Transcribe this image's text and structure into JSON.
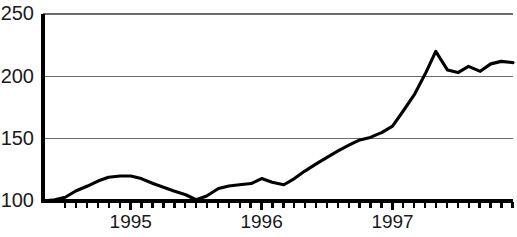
{
  "chart_data": {
    "type": "line",
    "title": "",
    "subtitle": "",
    "xlabel": "",
    "ylabel": "",
    "xlim": [
      1994.33,
      1997.92
    ],
    "ylim": [
      100,
      250
    ],
    "grid": true,
    "grid_axis": "y",
    "legend": false,
    "legend_position": "none",
    "y_ticks": [
      100,
      150,
      200,
      250
    ],
    "y_tick_labels": [
      "100",
      "150",
      "200",
      "250"
    ],
    "x_ticks": [
      1995,
      1996,
      1997
    ],
    "x_tick_labels": [
      "1995",
      "1996",
      "1997"
    ],
    "x_minor_tick_interval": 0.0833,
    "series": [
      {
        "name": "index",
        "color": "#000000",
        "x": [
          1994.33,
          1994.42,
          1994.5,
          1994.58,
          1994.67,
          1994.75,
          1994.83,
          1994.92,
          1995.0,
          1995.08,
          1995.17,
          1995.25,
          1995.33,
          1995.42,
          1995.5,
          1995.58,
          1995.67,
          1995.75,
          1995.83,
          1995.92,
          1996.0,
          1996.08,
          1996.17,
          1996.25,
          1996.33,
          1996.42,
          1996.5,
          1996.58,
          1996.67,
          1996.75,
          1996.83,
          1996.92,
          1997.0,
          1997.08,
          1997.17,
          1997.25,
          1997.33,
          1997.42,
          1997.5,
          1997.58,
          1997.67,
          1997.75,
          1997.83,
          1997.92
        ],
        "values": [
          100,
          101,
          103,
          108,
          112,
          116,
          119,
          120,
          120,
          118,
          114,
          111,
          108,
          105,
          101,
          104,
          110,
          112,
          113,
          114,
          118,
          115,
          113,
          118,
          124,
          130,
          135,
          140,
          145,
          149,
          151,
          155,
          160,
          172,
          186,
          202,
          220,
          205,
          203,
          208,
          204,
          210,
          212,
          211
        ]
      }
    ]
  }
}
